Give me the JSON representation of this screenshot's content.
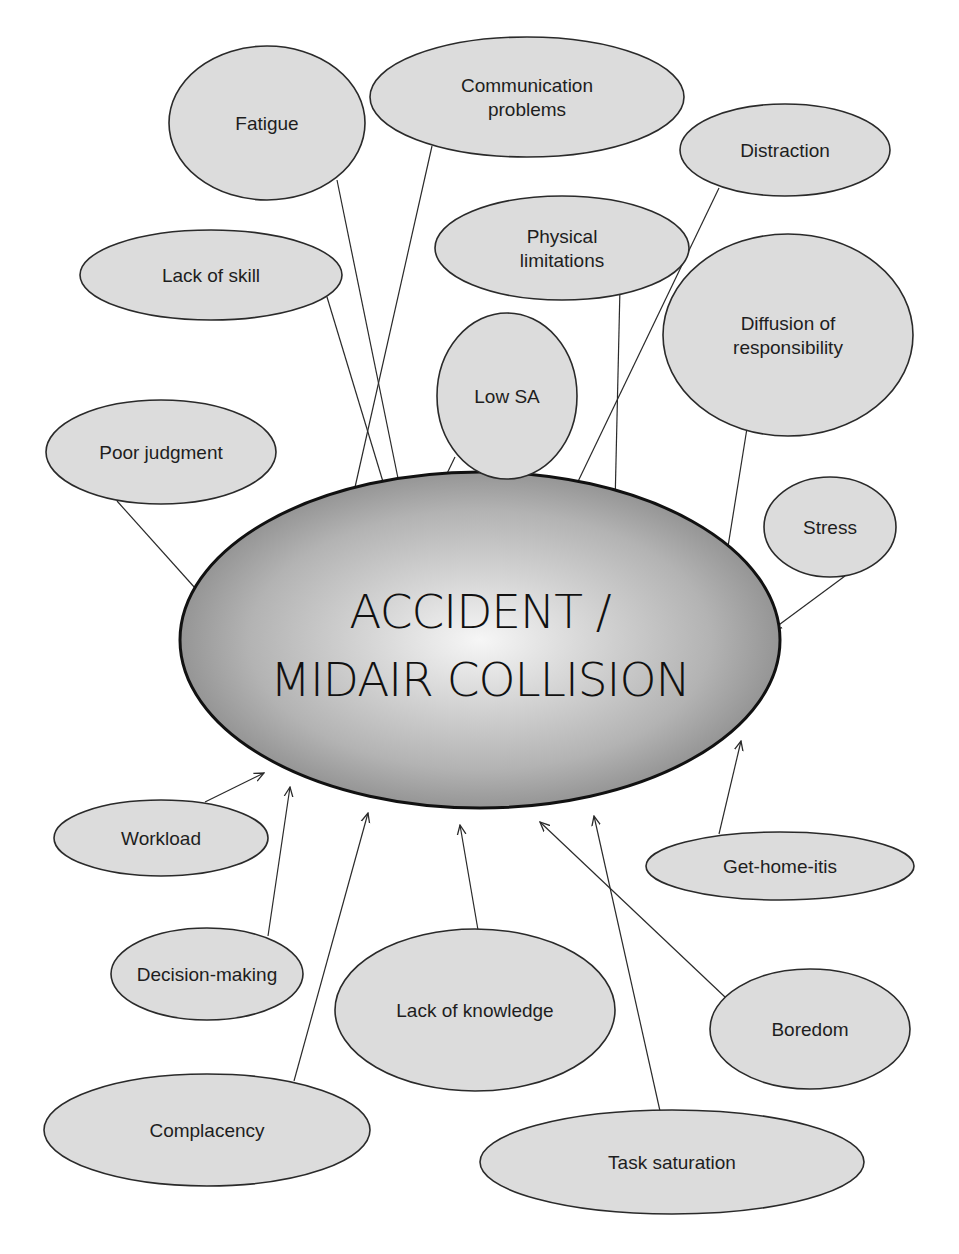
{
  "diagram": {
    "center": {
      "lines": [
        "ACCIDENT /",
        "MIDAIR COLLISION"
      ],
      "cx": 480,
      "cy": 640,
      "rx": 300,
      "ry": 168
    },
    "colors": {
      "node_fill": "#dcdcdc",
      "node_stroke": "#2a2a2a",
      "center_gradient_inner": "#f4f4f4",
      "center_gradient_outer": "#8a8a8a",
      "background": "#ffffff"
    },
    "nodes": [
      {
        "id": "fatigue",
        "lines": [
          "Fatigue"
        ],
        "cx": 267,
        "cy": 123,
        "rx": 98,
        "ry": 77,
        "edge": [
          337,
          180,
          401,
          493
        ]
      },
      {
        "id": "communication-problems",
        "lines": [
          "Communication",
          "problems"
        ],
        "cx": 527,
        "cy": 97,
        "rx": 157,
        "ry": 60,
        "edge": [
          432,
          146,
          351,
          505
        ]
      },
      {
        "id": "distraction",
        "lines": [
          "Distraction"
        ],
        "cx": 785,
        "cy": 150,
        "rx": 105,
        "ry": 46,
        "edge": [
          719,
          188,
          572,
          494
        ]
      },
      {
        "id": "lack-of-skill",
        "lines": [
          "Lack of skill"
        ],
        "cx": 211,
        "cy": 275,
        "rx": 131,
        "ry": 45,
        "edge": [
          327,
          297,
          387,
          495
        ]
      },
      {
        "id": "physical-limitations",
        "lines": [
          "Physical",
          "limitations"
        ],
        "cx": 562,
        "cy": 248,
        "rx": 127,
        "ry": 52,
        "edge": [
          620,
          287,
          615,
          505
        ]
      },
      {
        "id": "diffusion-of-responsibility",
        "lines": [
          "Diffusion of",
          "responsibility"
        ],
        "cx": 788,
        "cy": 335,
        "rx": 125,
        "ry": 101,
        "edge": [
          748,
          422,
          726,
          559
        ]
      },
      {
        "id": "low-sa",
        "lines": [
          "Low SA"
        ],
        "cx": 507,
        "cy": 396,
        "rx": 70,
        "ry": 83,
        "edge": [
          455,
          457,
          440,
          488
        ]
      },
      {
        "id": "poor-judgment",
        "lines": [
          "Poor judgment"
        ],
        "cx": 161,
        "cy": 452,
        "rx": 115,
        "ry": 52,
        "edge": [
          117,
          501,
          204,
          598
        ]
      },
      {
        "id": "stress",
        "lines": [
          "Stress"
        ],
        "cx": 830,
        "cy": 527,
        "rx": 66,
        "ry": 50,
        "edge": [
          845,
          576,
          772,
          630
        ]
      },
      {
        "id": "workload",
        "lines": [
          "Workload"
        ],
        "cx": 161,
        "cy": 838,
        "rx": 107,
        "ry": 38,
        "edge": [
          205,
          802,
          264,
          773
        ]
      },
      {
        "id": "get-home-itis",
        "lines": [
          "Get-home-itis"
        ],
        "cx": 780,
        "cy": 866,
        "rx": 134,
        "ry": 34,
        "edge": [
          719,
          834,
          741,
          741
        ]
      },
      {
        "id": "decision-making",
        "lines": [
          "Decision-making"
        ],
        "cx": 207,
        "cy": 974,
        "rx": 96,
        "ry": 46,
        "edge": [
          268,
          936,
          290,
          787
        ]
      },
      {
        "id": "lack-of-knowledge",
        "lines": [
          "Lack of knowledge"
        ],
        "cx": 475,
        "cy": 1010,
        "rx": 140,
        "ry": 81,
        "edge": [
          478,
          930,
          460,
          825
        ]
      },
      {
        "id": "boredom",
        "lines": [
          "Boredom"
        ],
        "cx": 810,
        "cy": 1029,
        "rx": 100,
        "ry": 60,
        "edge": [
          725,
          997,
          540,
          822
        ]
      },
      {
        "id": "complacency",
        "lines": [
          "Complacency"
        ],
        "cx": 207,
        "cy": 1130,
        "rx": 163,
        "ry": 56,
        "edge": [
          294,
          1081,
          368,
          813
        ]
      },
      {
        "id": "task-saturation",
        "lines": [
          "Task saturation"
        ],
        "cx": 672,
        "cy": 1162,
        "rx": 192,
        "ry": 52,
        "edge": [
          660,
          1111,
          594,
          816
        ]
      }
    ]
  }
}
